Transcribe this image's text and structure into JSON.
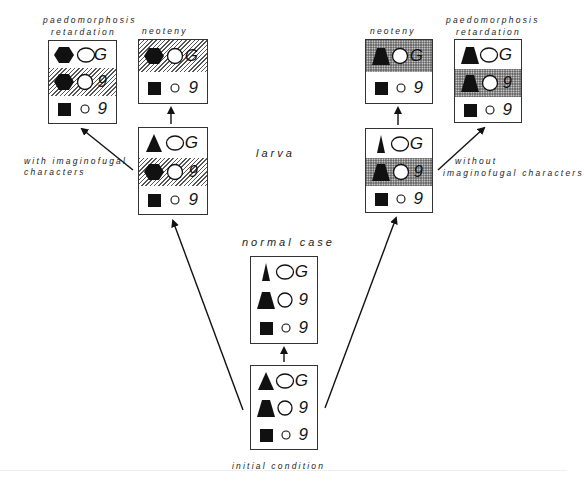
{
  "labels": {
    "left_paedo_1": "paedomorphosis",
    "left_paedo_2": "retardation",
    "left_neoteny": "neoteny",
    "right_neoteny": "neoteny",
    "right_paedo_1": "paedomorphosis",
    "right_paedo_2": "retardation",
    "larva": "larva",
    "with_1": "with  imaginofugal",
    "with_2": "characters",
    "without_1": "without",
    "without_2": "imaginofugal characters",
    "normal_case": "normal case",
    "initial_condition": "initial  condition"
  },
  "letters": {
    "G": "G",
    "g": "9"
  },
  "colors": {
    "ink": "#111111",
    "border": "#333333",
    "background": "#ffffff"
  },
  "boxes": [
    {
      "id": "left-paedomorphosis",
      "rows": [
        "hexagon-oval-G",
        "hexagon-circle-g (hatched)",
        "square-smallcircle-g"
      ]
    },
    {
      "id": "left-neoteny",
      "rows": [
        "hexagon-circle-G (hatched)",
        "square-smallcircle-g"
      ]
    },
    {
      "id": "left-larva",
      "rows": [
        "triangle-oval-G",
        "hexagon-circle-g (hatched)",
        "square-smallcircle-g"
      ]
    },
    {
      "id": "normal-case",
      "rows": [
        "narrow-triangle-oval-G",
        "trapezoid-circle-g",
        "square-smallcircle-g"
      ]
    },
    {
      "id": "initial-condition",
      "rows": [
        "triangle-oval-G",
        "trapezoid-circle-g",
        "square-smallcircle-g"
      ]
    },
    {
      "id": "right-neoteny",
      "rows": [
        "trapezoid-circle-G (dotted)",
        "square-smallcircle-g"
      ]
    },
    {
      "id": "right-larva",
      "rows": [
        "narrow-triangle-oval-G",
        "trapezoid-circle-g (dotted)",
        "square-smallcircle-g"
      ]
    },
    {
      "id": "right-paedomorphosis",
      "rows": [
        "trapezoid-oval-G",
        "trapezoid-circle-g (dotted)",
        "square-smallcircle-g"
      ]
    }
  ]
}
